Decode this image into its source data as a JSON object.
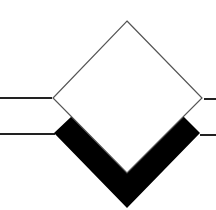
{
  "diagram": {
    "type": "relationship-diamond-symbol",
    "colors": {
      "background": "#ffffff",
      "fill_diamond": "#ffffff",
      "stroke": "#555555",
      "shadow": "#000000",
      "connector": "#222222"
    },
    "shapes": {
      "diamond": {
        "top": [
          127,
          21
        ],
        "right": [
          202,
          98
        ],
        "bottom": [
          127,
          173
        ],
        "left": [
          53,
          98
        ]
      },
      "shadow_v": [
        [
          54,
          133
        ],
        [
          72,
          116
        ],
        [
          127,
          172
        ],
        [
          183,
          116
        ],
        [
          200,
          133
        ],
        [
          127,
          208
        ]
      ],
      "connectors_left": [
        {
          "x1": 0,
          "y1": 98,
          "x2": 52,
          "y2": 98
        },
        {
          "x1": 0,
          "y1": 134,
          "x2": 55,
          "y2": 134
        }
      ],
      "connectors_right": [
        {
          "x1": 204,
          "y1": 99,
          "x2": 216,
          "y2": 99
        },
        {
          "x1": 200,
          "y1": 135,
          "x2": 216,
          "y2": 135
        }
      ]
    }
  }
}
